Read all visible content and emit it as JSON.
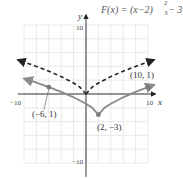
{
  "chart_data": {
    "type": "line",
    "function_label": {
      "prefix": "F(x) = (x−2)",
      "exponent_num": "2",
      "exponent_den": "3",
      "suffix": " − 3"
    },
    "xlabel": "x",
    "ylabel": "y",
    "xlim": [
      -10,
      10
    ],
    "ylim": [
      -10,
      10
    ],
    "grid": true,
    "x_tick_labels": [
      "−10",
      "10"
    ],
    "y_tick_labels": [
      "10",
      "−10"
    ],
    "series": [
      {
        "name": "F(x) = (x−2)^(2/3) − 3",
        "style": "solid",
        "color": "#8a8a8a",
        "x": [
          -10,
          -8,
          -6,
          -4,
          -2,
          0,
          1,
          2,
          3,
          4,
          6,
          8,
          10,
          11
        ],
        "y": [
          2.24,
          1.64,
          1.0,
          0.3,
          -0.48,
          -1.41,
          -2.0,
          -3.0,
          -2.0,
          -1.41,
          -0.48,
          0.3,
          1.0,
          1.33
        ]
      },
      {
        "name": "y = x^(2/3) (reference, dashed)",
        "style": "dashed",
        "color": "#222222",
        "x": [
          -11,
          -8,
          -6,
          -4,
          -2,
          -1,
          0,
          1,
          2,
          4,
          6,
          8,
          11
        ],
        "y": [
          4.95,
          4.0,
          3.3,
          2.52,
          1.59,
          1.0,
          0,
          1.0,
          1.59,
          2.52,
          3.3,
          4.0,
          4.95
        ]
      }
    ],
    "annotations": [
      {
        "label": "(−6, 1)",
        "x": -6,
        "y": 1
      },
      {
        "label": "(2, −3)",
        "x": 2,
        "y": -3
      },
      {
        "label": "(10, 1)",
        "x": 10,
        "y": 1
      }
    ],
    "colors": {
      "curve": "#8a8a8a",
      "dashed": "#222222",
      "axis": "#222222",
      "grid": "#e4e4e4"
    }
  }
}
